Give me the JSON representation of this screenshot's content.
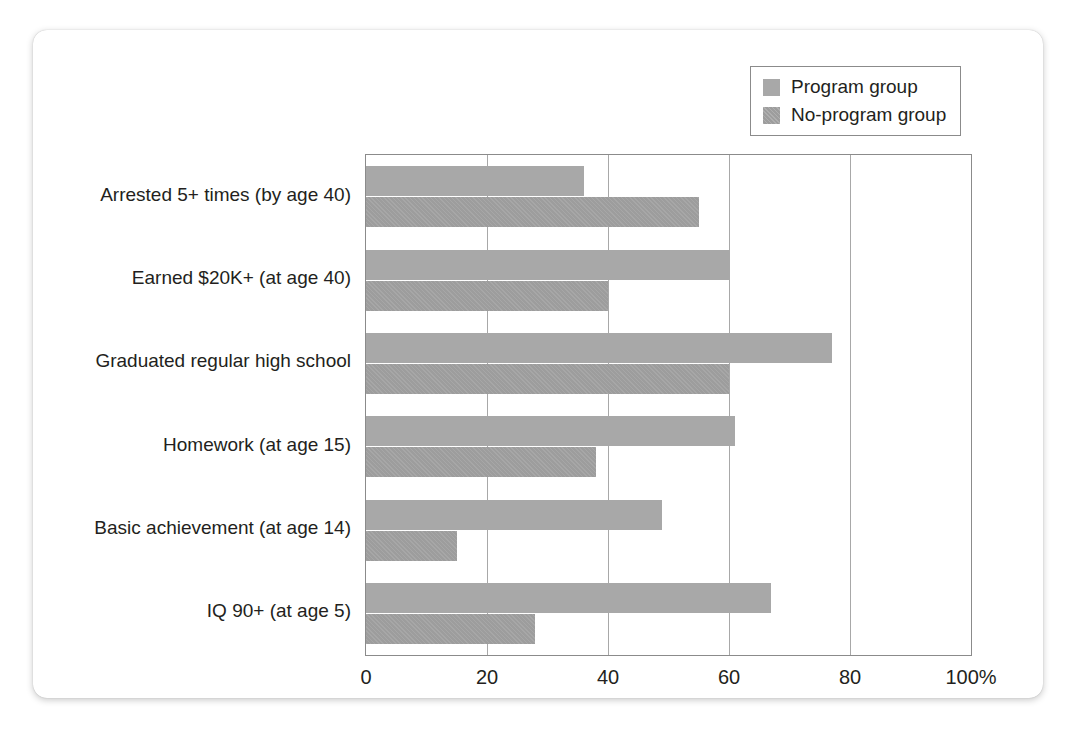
{
  "chart_data": {
    "type": "bar",
    "orientation": "horizontal",
    "title": "",
    "xlabel": "",
    "ylabel": "",
    "xlim": [
      0,
      100
    ],
    "grid": true,
    "grid_axis": "x",
    "legend_position": "top-right",
    "xticks": [
      0,
      20,
      40,
      60,
      80,
      100
    ],
    "xtick_labels": [
      "0",
      "20",
      "40",
      "60",
      "80",
      "100%"
    ],
    "categories": [
      "Arrested 5+ times (by age 40)",
      "Earned $20K+ (at age 40)",
      "Graduated regular high school",
      "Homework (at age 15)",
      "Basic achievement (at age 14)",
      "IQ 90+ (at age 5)"
    ],
    "series": [
      {
        "name": "Program group",
        "color": "#a8a8a8",
        "values": [
          36,
          60,
          77,
          61,
          49,
          67
        ]
      },
      {
        "name": "No-program group",
        "color": "#9d9d9d",
        "values": [
          55,
          40,
          60,
          38,
          15,
          28
        ]
      }
    ]
  },
  "legend": {
    "items": [
      {
        "label": "Program group",
        "swatch": "program"
      },
      {
        "label": "No-program group",
        "swatch": "noprogram"
      }
    ]
  },
  "colors": {
    "program": "#a8a8a8",
    "no_program": "#9d9d9d",
    "axis": "#8b8b8b",
    "gridline": "#a8a8a8",
    "text": "#231f20",
    "card_background": "#ffffff"
  }
}
